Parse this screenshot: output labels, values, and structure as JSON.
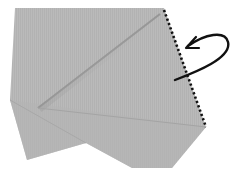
{
  "diagram": {
    "type": "origami-fold-step",
    "colors": {
      "paper": "#b9b9b9",
      "paper_shade": "#a9a9a9",
      "crease": "#8e8e8e",
      "fold_line": "#111111",
      "arrow": "#111111",
      "background": "#ffffff"
    },
    "symbols": [
      {
        "name": "mountain-fold-line",
        "style": "dotted"
      },
      {
        "name": "fold-behind-arrow",
        "style": "curved"
      }
    ]
  }
}
